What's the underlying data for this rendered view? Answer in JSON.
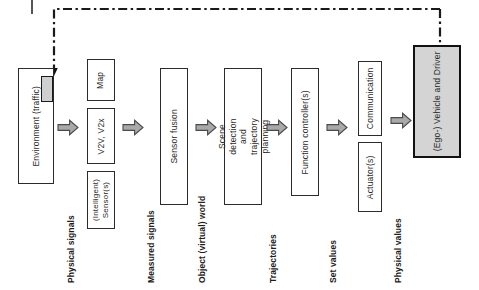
{
  "diagram": {
    "orientation": "rotated-90",
    "blocks": [
      {
        "id": "environment",
        "label": "Environment  (traffic)",
        "style": "plain"
      },
      {
        "id": "map",
        "label": "Map",
        "style": "plain"
      },
      {
        "id": "v2v",
        "label": "V2V, V2x",
        "style": "plain"
      },
      {
        "id": "sensors",
        "label": "(Intelligent) Sensor(s)",
        "style": "plain"
      },
      {
        "id": "sensor-fusion",
        "label": "Sensor fusion",
        "style": "plain"
      },
      {
        "id": "scene-detection",
        "label": "Scene detection and trajectory planning",
        "style": "plain"
      },
      {
        "id": "function-controller",
        "label": "Function controller(s)",
        "style": "plain"
      },
      {
        "id": "communication",
        "label": "Communication",
        "style": "plain"
      },
      {
        "id": "actuators",
        "label": "Actuator(s)",
        "style": "plain"
      },
      {
        "id": "ego-vehicle",
        "label": "(Ego-) Vehicle and Driver",
        "style": "filled"
      }
    ],
    "flow_labels": [
      {
        "id": "physical-signals",
        "label": "Physical signals"
      },
      {
        "id": "measured-signals",
        "label": "Measured signals"
      },
      {
        "id": "object-world",
        "label": "Object (virtual) world"
      },
      {
        "id": "trajectories",
        "label": "Trajectories"
      },
      {
        "id": "set-values",
        "label": "Set values"
      },
      {
        "id": "physical-values",
        "label": "Physical values"
      }
    ],
    "colors": {
      "box_border": "#2b2b2b",
      "emphasis_border": "#111111",
      "fill_gray": "#d4d4d4",
      "arrow_fill": "#a9a9a9",
      "arrow_stroke": "#4a4a4a",
      "feedback_line": "#1a1a1a",
      "text": "#2a2a2a",
      "background": "#ffffff"
    },
    "feedback_path": {
      "id": "feedback-loop",
      "style": "dash-dot",
      "from": "ego-vehicle",
      "to": "environment"
    }
  }
}
